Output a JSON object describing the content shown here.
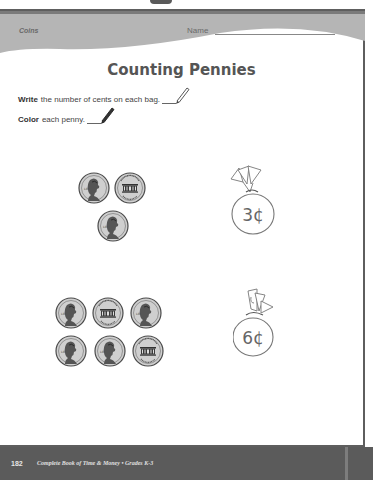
{
  "header": {
    "subject": "Coins",
    "name_label": "Name"
  },
  "title": "Counting Pennies",
  "instructions": [
    {
      "bold": "Write",
      "text": "the number of cents on each bag.",
      "icon": "pencil-icon"
    },
    {
      "bold": "Color",
      "text": "each penny.",
      "icon": "pencil-icon"
    }
  ],
  "problems": [
    {
      "coins": [
        "penny-heads",
        "penny-tails",
        "penny-heads"
      ],
      "bag_value": "3¢"
    },
    {
      "coins": [
        "penny-heads",
        "penny-tails",
        "penny-heads",
        "penny-heads",
        "penny-heads",
        "penny-tails"
      ],
      "bag_value": "6¢"
    }
  ],
  "footer": {
    "page_number": "182",
    "book_title": "Complete Book of Time & Money  •  Grades K-3"
  },
  "colors": {
    "header_band": "#b5b5b5",
    "footer_band": "#5b5b5b",
    "border": "#5e5e5e",
    "coin_fill": "#c8c8c8",
    "coin_stroke": "#555555"
  }
}
